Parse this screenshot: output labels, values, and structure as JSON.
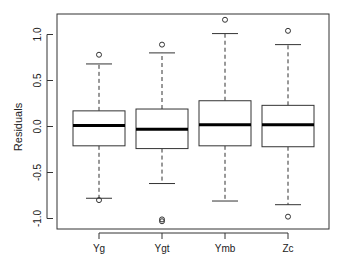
{
  "chart_data": {
    "type": "boxplot",
    "title": "",
    "xlabel": "",
    "ylabel": "Residuals",
    "ylim": [
      -1.1,
      1.22
    ],
    "yticks": [
      -1.0,
      -0.5,
      0.0,
      0.5,
      1.0
    ],
    "ytick_labels": [
      "-1.0",
      "-0.5",
      "0.0",
      "0.5",
      "1.0"
    ],
    "categories": [
      "Yg",
      "Ygt",
      "Ymb",
      "Zc"
    ],
    "grid": false,
    "legend": null,
    "boxes": [
      {
        "name": "Yg",
        "whisker_low": -0.78,
        "q1": -0.21,
        "median": 0.01,
        "q3": 0.17,
        "whisker_high": 0.68,
        "outliers": [
          0.78,
          -0.8
        ]
      },
      {
        "name": "Ygt",
        "whisker_low": -0.62,
        "q1": -0.24,
        "median": -0.03,
        "q3": 0.19,
        "whisker_high": 0.8,
        "outliers": [
          0.89,
          -1.01,
          -1.03
        ]
      },
      {
        "name": "Ymb",
        "whisker_low": -0.81,
        "q1": -0.21,
        "median": 0.02,
        "q3": 0.28,
        "whisker_high": 1.01,
        "outliers": [
          1.16
        ]
      },
      {
        "name": "Zc",
        "whisker_low": -0.85,
        "q1": -0.22,
        "median": 0.02,
        "q3": 0.23,
        "whisker_high": 0.89,
        "outliers": [
          1.04,
          -0.98
        ]
      }
    ]
  }
}
